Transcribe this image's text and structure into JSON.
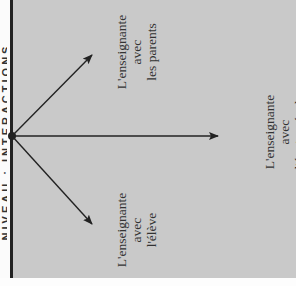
{
  "diagram": {
    "side_heading": "NIVEAU : INTERACTIONS",
    "labels": {
      "parents": {
        "line1": "L'enseignante",
        "line2": "avec",
        "line3": "les parents"
      },
      "team": {
        "line1": "L'enseignante",
        "line2": "avec",
        "line3": "l'équipe-école"
      },
      "student": {
        "line1": "L'enseignante",
        "line2": "avec",
        "line3": "l'élève"
      }
    },
    "colors": {
      "panel_bg": "#c9c9c9",
      "line": "#222222",
      "text": "#333333"
    }
  }
}
